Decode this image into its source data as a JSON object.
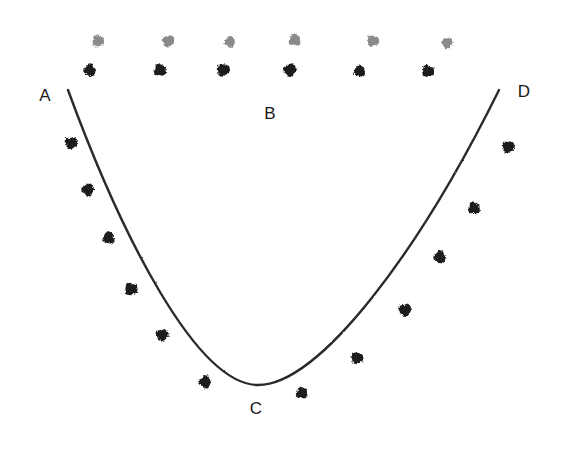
{
  "figure": {
    "background_color": "#ffffff",
    "stroke_color": "#2b2b2b",
    "width": 566,
    "height": 450,
    "labels": [
      {
        "text": "A",
        "x": 45,
        "y": 95,
        "name": "vertex-label-a"
      },
      {
        "text": "B",
        "x": 270,
        "y": 113,
        "name": "vertex-label-b"
      },
      {
        "text": "C",
        "x": 256,
        "y": 408,
        "name": "vertex-label-c"
      },
      {
        "text": "D",
        "x": 524,
        "y": 91,
        "name": "vertex-label-d"
      }
    ],
    "chord": {
      "name": "chord-ad",
      "from": {
        "x": 68,
        "y": 90
      },
      "to": {
        "x": 499,
        "y": 90
      },
      "stroke": "#2b2b2b",
      "stroke_width": 2.2
    },
    "curve": {
      "name": "catenary-curve-acd",
      "path": "M 68 90 C 120 232, 196 385, 258 385 C 320 385, 420 250, 499 90",
      "stroke": "#2b2b2b",
      "stroke_width": 2.4,
      "vertex": {
        "x": 258,
        "y": 385
      }
    },
    "marker_colors": {
      "black": "#1a1a1a",
      "gray": "#8a8a8a"
    },
    "markers": [
      {
        "x": 98,
        "y": 41,
        "color": "gray",
        "r": 6.0,
        "group": "top-gray-row"
      },
      {
        "x": 168,
        "y": 41,
        "color": "gray",
        "r": 6.0,
        "group": "top-gray-row"
      },
      {
        "x": 230,
        "y": 42,
        "color": "gray",
        "r": 5.6,
        "group": "top-gray-row"
      },
      {
        "x": 295,
        "y": 40,
        "color": "gray",
        "r": 6.2,
        "group": "top-gray-row"
      },
      {
        "x": 373,
        "y": 41,
        "color": "gray",
        "r": 5.8,
        "group": "top-gray-row"
      },
      {
        "x": 447,
        "y": 43,
        "color": "gray",
        "r": 5.4,
        "group": "top-gray-row"
      },
      {
        "x": 90,
        "y": 70,
        "color": "black",
        "r": 6.4,
        "group": "top-black-row"
      },
      {
        "x": 160,
        "y": 70,
        "color": "black",
        "r": 6.4,
        "group": "top-black-row"
      },
      {
        "x": 223,
        "y": 70,
        "color": "black",
        "r": 6.4,
        "group": "top-black-row"
      },
      {
        "x": 290,
        "y": 70,
        "color": "black",
        "r": 6.6,
        "group": "top-black-row"
      },
      {
        "x": 360,
        "y": 71,
        "color": "black",
        "r": 6.0,
        "group": "top-black-row"
      },
      {
        "x": 428,
        "y": 71,
        "color": "black",
        "r": 6.2,
        "group": "top-black-row"
      },
      {
        "x": 71,
        "y": 143,
        "color": "black",
        "r": 6.4,
        "group": "left-arc"
      },
      {
        "x": 88,
        "y": 190,
        "color": "black",
        "r": 6.4,
        "group": "left-arc"
      },
      {
        "x": 109,
        "y": 238,
        "color": "black",
        "r": 6.4,
        "group": "left-arc"
      },
      {
        "x": 131,
        "y": 289,
        "color": "black",
        "r": 6.4,
        "group": "left-arc"
      },
      {
        "x": 162,
        "y": 335,
        "color": "black",
        "r": 6.2,
        "group": "left-arc"
      },
      {
        "x": 205,
        "y": 382,
        "color": "black",
        "r": 6.4,
        "group": "left-arc"
      },
      {
        "x": 302,
        "y": 393,
        "color": "black",
        "r": 6.0,
        "group": "right-arc"
      },
      {
        "x": 357,
        "y": 358,
        "color": "black",
        "r": 6.0,
        "group": "right-arc"
      },
      {
        "x": 405,
        "y": 310,
        "color": "black",
        "r": 6.4,
        "group": "right-arc"
      },
      {
        "x": 440,
        "y": 257,
        "color": "black",
        "r": 6.4,
        "group": "right-arc"
      },
      {
        "x": 474,
        "y": 208,
        "color": "black",
        "r": 6.2,
        "group": "right-arc"
      },
      {
        "x": 508,
        "y": 147,
        "color": "black",
        "r": 6.2,
        "group": "right-arc"
      }
    ]
  }
}
